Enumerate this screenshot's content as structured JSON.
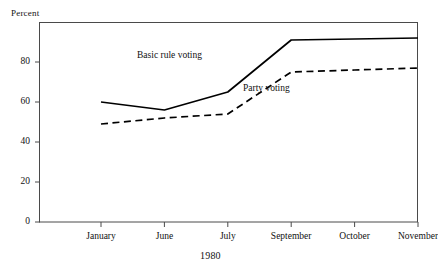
{
  "figure": {
    "y_axis_title": "Percent",
    "x_axis_title": "1980"
  },
  "annotations": {
    "basic_rule": "Basic rule voting",
    "party": "Party voting"
  },
  "chart_data": {
    "type": "line",
    "title": "",
    "subtitle": "",
    "xlabel": "1980",
    "ylabel": "Percent",
    "categories": [
      "January",
      "June",
      "July",
      "September",
      "October",
      "November"
    ],
    "ytick_labels": [
      "0",
      "20",
      "40",
      "60",
      "80"
    ],
    "ytick_values": [
      0,
      20,
      40,
      60,
      80
    ],
    "ylim": [
      0,
      100
    ],
    "grid": false,
    "legend_position": "inline-annotation",
    "series": [
      {
        "name": "Basic rule voting",
        "style": "solid",
        "color": "#000000",
        "values": [
          60,
          56,
          65,
          91,
          91.5,
          92
        ]
      },
      {
        "name": "Party voting",
        "style": "dashed",
        "color": "#000000",
        "values": [
          49,
          52,
          54,
          75,
          76,
          77
        ]
      }
    ]
  }
}
